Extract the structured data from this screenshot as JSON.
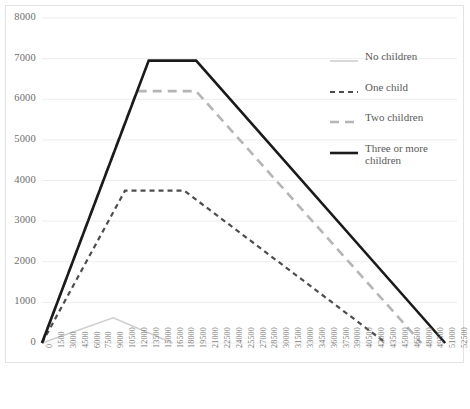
{
  "chart_data": {
    "type": "line",
    "title": "",
    "xlabel": "",
    "ylabel": "",
    "xlim": [
      0,
      52500
    ],
    "ylim": [
      0,
      8000
    ],
    "grid": true,
    "legend_position": "right",
    "x_ticks": [
      "0",
      "1500",
      "3000",
      "4500",
      "6000",
      "7500",
      "9000",
      "10500",
      "12000",
      "13500",
      "15000",
      "16500",
      "18000",
      "19500",
      "21000",
      "22500",
      "24000",
      "25500",
      "27000",
      "28500",
      "30000",
      "31500",
      "33000",
      "34500",
      "36000",
      "37500",
      "39000",
      "40500",
      "42000",
      "43500",
      "45000",
      "46500",
      "48000",
      "49500",
      "51000",
      "52500"
    ],
    "y_ticks": [
      "0",
      "1000",
      "2000",
      "3000",
      "4000",
      "5000",
      "6000",
      "7000",
      "8000"
    ],
    "series": [
      {
        "name": "No children",
        "color": "#cfcfcf",
        "style": "solid",
        "width": 1.6,
        "points": [
          [
            0,
            0
          ],
          [
            9000,
            620
          ],
          [
            16500,
            0
          ]
        ]
      },
      {
        "name": "One child",
        "color": "#4d4d4d",
        "style": "dashed",
        "width": 2.2,
        "points": [
          [
            0,
            0
          ],
          [
            10500,
            3750
          ],
          [
            18000,
            3750
          ],
          [
            43500,
            0
          ]
        ]
      },
      {
        "name": "Two children",
        "color": "#b5b5b5",
        "style": "dashed",
        "width": 2.6,
        "points": [
          [
            0,
            0
          ],
          [
            12000,
            6200
          ],
          [
            19500,
            6200
          ],
          [
            48000,
            0
          ]
        ]
      },
      {
        "name": "Three or more children",
        "color": "#1a1a1a",
        "style": "solid",
        "width": 2.6,
        "points": [
          [
            0,
            0
          ],
          [
            13500,
            6950
          ],
          [
            19500,
            6950
          ],
          [
            51000,
            0
          ]
        ]
      }
    ]
  },
  "legend": {
    "items": [
      {
        "label": "No children"
      },
      {
        "label": "One child"
      },
      {
        "label": "Two children"
      },
      {
        "label": "Three or more children"
      }
    ]
  },
  "colors": {
    "grid": "#ededed",
    "border": "#e2e2e2",
    "axis_text": "#6d6d6d",
    "legend_text": "#5a5a5a"
  }
}
